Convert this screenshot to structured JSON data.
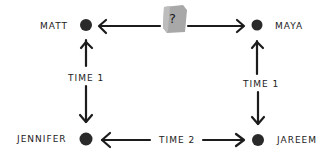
{
  "diagram": {
    "type": "relationship-network",
    "colors": {
      "background": "#ffffff",
      "ink": "#1c1c1c",
      "node": "#2a2a2a",
      "badge": "#a8a8a8"
    },
    "nodes": [
      {
        "id": "matt",
        "label": "MATT",
        "x": 86,
        "y": 25
      },
      {
        "id": "maya",
        "label": "MAYA",
        "x": 257,
        "y": 25
      },
      {
        "id": "jennifer",
        "label": "JENNIFER",
        "x": 86,
        "y": 139
      },
      {
        "id": "jareem",
        "label": "JAREEM",
        "x": 258,
        "y": 140
      }
    ],
    "edges": [
      {
        "from": "matt",
        "to": "maya",
        "label": "?",
        "style": "bidirectional",
        "badge": true
      },
      {
        "from": "matt",
        "to": "jennifer",
        "label": "TIME 1",
        "style": "bidirectional"
      },
      {
        "from": "maya",
        "to": "jareem",
        "label": "TIME 1",
        "style": "bidirectional"
      },
      {
        "from": "jennifer",
        "to": "jareem",
        "label": "TIME 2",
        "style": "bidirectional"
      }
    ],
    "labels": {
      "matt": "MATT",
      "maya": "MAYA",
      "jennifer": "JENNIFER",
      "jareem": "JAREEM",
      "left_edge": "TIME 1",
      "right_edge": "TIME 1",
      "bottom_edge": "TIME 2",
      "top_edge_badge": "?"
    }
  }
}
